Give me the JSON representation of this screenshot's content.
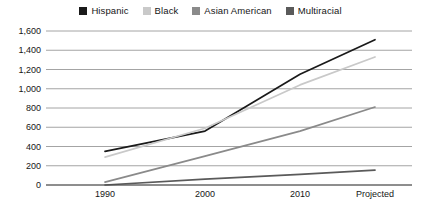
{
  "chart_data": {
    "type": "line",
    "title": "",
    "xlabel": "",
    "ylabel": "",
    "x": [
      "1990",
      "2000",
      "2010",
      "Projected"
    ],
    "categories": [
      "1990",
      "2000",
      "2010",
      "Projected"
    ],
    "ylim": [
      0,
      1600
    ],
    "ytick_values": [
      0,
      200,
      400,
      600,
      800,
      1000,
      1200,
      1400,
      1600
    ],
    "ytick_labels": [
      "0",
      "200",
      "400",
      "600",
      "800",
      "1,000",
      "1,200",
      "1,400",
      "1,600"
    ],
    "grid": true,
    "grid_axis": "y",
    "legend_position": "top-center",
    "series": [
      {
        "name": "Hispanic",
        "color": "#1a1a1a",
        "values": [
          350,
          560,
          1150,
          1510
        ]
      },
      {
        "name": "Black",
        "color": "#c9c9c9",
        "values": [
          290,
          590,
          1040,
          1330
        ]
      },
      {
        "name": "Asian American",
        "color": "#8a8a8a",
        "values": [
          30,
          300,
          560,
          810
        ]
      },
      {
        "name": "Multiracial",
        "color": "#5a5a5a",
        "values": [
          0,
          60,
          110,
          155
        ]
      }
    ]
  },
  "legend": {
    "items": [
      {
        "label": "Hispanic",
        "color": "#1a1a1a"
      },
      {
        "label": "Black",
        "color": "#c9c9c9"
      },
      {
        "label": "Asian American",
        "color": "#8a8a8a"
      },
      {
        "label": "Multiracial",
        "color": "#5a5a5a"
      }
    ]
  },
  "axes": {
    "y_labels": [
      "1,600",
      "1,400",
      "1,200",
      "1,000",
      "800",
      "600",
      "400",
      "200",
      "0"
    ],
    "x_labels": [
      "1990",
      "2000",
      "2010",
      "Projected"
    ]
  },
  "colors": {
    "grid": "#9a9a9a",
    "axis": "#4a4a4a",
    "text": "#161616",
    "background": "#ffffff"
  }
}
